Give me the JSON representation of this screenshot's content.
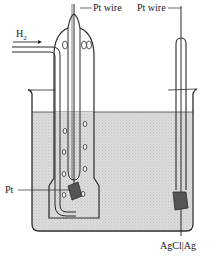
{
  "diagram": {
    "labels": {
      "pt_wire_left": "Pt wire",
      "pt_wire_right": "Pt wire",
      "hydrogen_gas": "H",
      "hydrogen_subscript": "2",
      "pt_electrode": "Pt",
      "agcl_electrode": "AgCl|Ag"
    },
    "colors": {
      "line": "#2a2a2a",
      "solution": "#d6d6d6",
      "electrode": "#555555",
      "background": "#ffffff"
    }
  }
}
